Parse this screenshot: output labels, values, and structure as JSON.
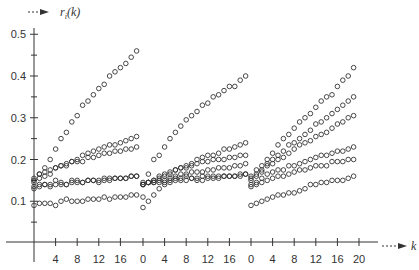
{
  "chart_data": {
    "type": "scatter",
    "title": "",
    "xlabel": "k",
    "ylabel": "r_i(k)",
    "ylabel_display": "r",
    "ylabel_sub": "i",
    "ylabel_suffix": "(k)",
    "ylim": [
      0,
      0.5
    ],
    "y_ticks": [
      {
        "value": 0.1,
        "label": "0.1"
      },
      {
        "value": 0.2,
        "label": "0.2"
      },
      {
        "value": 0.3,
        "label": "0.3"
      },
      {
        "value": 0.4,
        "label": "0.4"
      },
      {
        "value": 0.5,
        "label": "0.5"
      }
    ],
    "y_minor_ticks": [
      0.05,
      0.15,
      0.25,
      0.35,
      0.45
    ],
    "grid": false,
    "legend": null,
    "marker": "open-circle",
    "panels": [
      {
        "name": "segment-1",
        "k_offset_px": 34,
        "tick_labels": [
          "4",
          "8",
          "12",
          "16"
        ],
        "tick_values": [
          4,
          8,
          12,
          16
        ],
        "k": [
          0,
          1,
          2,
          3,
          4,
          5,
          6,
          7,
          8,
          9,
          10,
          11,
          12,
          13,
          14,
          15,
          16,
          17,
          18,
          19
        ],
        "series": [
          {
            "name": "series-1",
            "values": [
              0.15,
              0.165,
              0.18,
              0.2,
              0.225,
              0.25,
              0.265,
              0.29,
              0.305,
              0.33,
              0.34,
              0.355,
              0.37,
              0.38,
              0.4,
              0.41,
              0.42,
              0.43,
              0.445,
              0.46
            ]
          },
          {
            "name": "series-2",
            "values": [
              0.155,
              0.165,
              0.17,
              0.175,
              0.18,
              0.185,
              0.185,
              0.195,
              0.2,
              0.21,
              0.215,
              0.22,
              0.225,
              0.23,
              0.235,
              0.235,
              0.24,
              0.245,
              0.25,
              0.255
            ]
          },
          {
            "name": "series-3",
            "values": [
              0.145,
              0.155,
              0.16,
              0.165,
              0.18,
              0.185,
              0.19,
              0.195,
              0.195,
              0.195,
              0.205,
              0.205,
              0.21,
              0.215,
              0.215,
              0.22,
              0.22,
              0.225,
              0.225,
              0.23
            ]
          },
          {
            "name": "series-4",
            "values": [
              0.135,
              0.14,
              0.14,
              0.135,
              0.15,
              0.145,
              0.14,
              0.15,
              0.15,
              0.145,
              0.15,
              0.15,
              0.145,
              0.155,
              0.15,
              0.155,
              0.155,
              0.155,
              0.16,
              0.16
            ]
          },
          {
            "name": "series-5",
            "values": [
              0.13,
              0.135,
              0.14,
              0.14,
              0.14,
              0.14,
              0.14,
              0.145,
              0.145,
              0.145,
              0.15,
              0.15,
              0.15,
              0.15,
              0.155,
              0.155,
              0.155,
              0.155,
              0.16,
              0.16
            ]
          },
          {
            "name": "series-6",
            "values": [
              0.09,
              0.095,
              0.095,
              0.095,
              0.09,
              0.1,
              0.105,
              0.1,
              0.1,
              0.1,
              0.105,
              0.105,
              0.105,
              0.11,
              0.105,
              0.11,
              0.11,
              0.11,
              0.115,
              0.115
            ]
          }
        ]
      },
      {
        "name": "segment-2",
        "k_offset_px": 143,
        "tick_labels": [
          "0",
          "4",
          "8",
          "12",
          "16"
        ],
        "tick_values": [
          0,
          4,
          8,
          12,
          16
        ],
        "k": [
          0,
          1,
          2,
          3,
          4,
          5,
          6,
          7,
          8,
          9,
          10,
          11,
          12,
          13,
          14,
          15,
          16,
          17,
          18,
          19
        ],
        "series": [
          {
            "name": "series-1",
            "values": [
              0.11,
              0.165,
              0.2,
              0.21,
              0.23,
              0.25,
              0.265,
              0.28,
              0.295,
              0.305,
              0.315,
              0.33,
              0.335,
              0.35,
              0.355,
              0.365,
              0.375,
              0.375,
              0.39,
              0.4
            ]
          },
          {
            "name": "series-2",
            "values": [
              0.14,
              0.145,
              0.15,
              0.16,
              0.165,
              0.17,
              0.175,
              0.18,
              0.185,
              0.19,
              0.2,
              0.205,
              0.21,
              0.21,
              0.215,
              0.225,
              0.225,
              0.23,
              0.235,
              0.24
            ]
          },
          {
            "name": "series-3",
            "values": [
              0.14,
              0.145,
              0.15,
              0.155,
              0.16,
              0.165,
              0.175,
              0.18,
              0.18,
              0.185,
              0.19,
              0.195,
              0.195,
              0.2,
              0.2,
              0.2,
              0.205,
              0.205,
              0.21,
              0.21
            ]
          },
          {
            "name": "series-4",
            "values": [
              0.145,
              0.145,
              0.145,
              0.15,
              0.15,
              0.155,
              0.16,
              0.165,
              0.165,
              0.17,
              0.17,
              0.17,
              0.175,
              0.175,
              0.18,
              0.18,
              0.18,
              0.185,
              0.185,
              0.19
            ]
          },
          {
            "name": "series-5",
            "values": [
              0.14,
              0.145,
              0.145,
              0.145,
              0.145,
              0.15,
              0.155,
              0.155,
              0.16,
              0.155,
              0.155,
              0.16,
              0.16,
              0.16,
              0.16,
              0.16,
              0.16,
              0.16,
              0.165,
              0.165
            ]
          },
          {
            "name": "series-6",
            "values": [
              0.085,
              0.1,
              0.115,
              0.13,
              0.14,
              0.145,
              0.15,
              0.15,
              0.15,
              0.155,
              0.15,
              0.15,
              0.155,
              0.155,
              0.155,
              0.16,
              0.16,
              0.16,
              0.16,
              0.165
            ]
          }
        ]
      },
      {
        "name": "segment-3",
        "k_offset_px": 251,
        "tick_labels": [
          "0",
          "4",
          "8",
          "12",
          "16",
          "20"
        ],
        "tick_values": [
          0,
          4,
          8,
          12,
          16,
          20
        ],
        "k": [
          0,
          1,
          2,
          3,
          4,
          5,
          6,
          7,
          8,
          9,
          10,
          11,
          12,
          13,
          14,
          15,
          16,
          17,
          18,
          19
        ],
        "series": [
          {
            "name": "series-1",
            "values": [
              0.16,
              0.175,
              0.185,
              0.2,
              0.215,
              0.235,
              0.25,
              0.26,
              0.275,
              0.29,
              0.3,
              0.31,
              0.325,
              0.34,
              0.35,
              0.355,
              0.375,
              0.39,
              0.4,
              0.42
            ]
          },
          {
            "name": "series-2",
            "values": [
              0.155,
              0.165,
              0.175,
              0.19,
              0.2,
              0.21,
              0.22,
              0.235,
              0.24,
              0.25,
              0.26,
              0.27,
              0.285,
              0.29,
              0.3,
              0.31,
              0.32,
              0.33,
              0.34,
              0.35
            ]
          },
          {
            "name": "series-3",
            "values": [
              0.15,
              0.16,
              0.17,
              0.185,
              0.19,
              0.2,
              0.205,
              0.215,
              0.225,
              0.235,
              0.24,
              0.245,
              0.255,
              0.26,
              0.265,
              0.275,
              0.285,
              0.29,
              0.3,
              0.305
            ]
          },
          {
            "name": "series-4",
            "values": [
              0.14,
              0.145,
              0.155,
              0.165,
              0.17,
              0.175,
              0.175,
              0.185,
              0.185,
              0.19,
              0.195,
              0.2,
              0.205,
              0.21,
              0.21,
              0.215,
              0.22,
              0.22,
              0.225,
              0.23
            ]
          },
          {
            "name": "series-5",
            "values": [
              0.135,
              0.14,
              0.145,
              0.15,
              0.155,
              0.16,
              0.16,
              0.165,
              0.17,
              0.175,
              0.175,
              0.18,
              0.185,
              0.185,
              0.185,
              0.195,
              0.195,
              0.195,
              0.2,
              0.2
            ]
          },
          {
            "name": "series-6",
            "values": [
              0.09,
              0.095,
              0.1,
              0.105,
              0.11,
              0.115,
              0.115,
              0.12,
              0.12,
              0.125,
              0.13,
              0.14,
              0.14,
              0.145,
              0.145,
              0.15,
              0.15,
              0.15,
              0.155,
              0.16
            ]
          }
        ]
      }
    ]
  },
  "axes": {
    "y_arrow_glyph": "dotted-arrow",
    "x_arrow_glyph": "dotted-arrow"
  },
  "colors": {
    "axis": "#333333",
    "marker_stroke": "#333333",
    "background": "#ffffff"
  }
}
